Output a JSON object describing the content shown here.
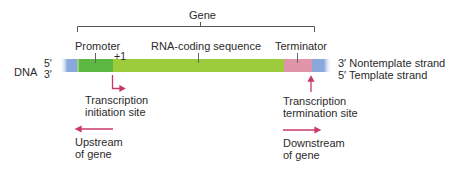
{
  "diagram": {
    "gene_label": "Gene",
    "dna_label": "DNA",
    "left_strand_ends": {
      "top": "5′",
      "bottom": "3′"
    },
    "right_strand_labels": {
      "top": "3′ Nontemplate strand",
      "bottom": "5′ Template strand"
    },
    "regions": [
      {
        "name": "promoter",
        "label": "Promoter",
        "color": "#5cb840"
      },
      {
        "name": "rna-coding-sequence",
        "label": "RNA-coding sequence",
        "color": "#9ccc3c"
      },
      {
        "name": "terminator",
        "label": "Terminator",
        "color": "#e096a8"
      }
    ],
    "flank_color": "#8aa8dc",
    "plus_one_label": "+1",
    "initiation_site": {
      "line1": "Transcription",
      "line2": "initiation site"
    },
    "termination_site": {
      "line1": "Transcription",
      "line2": "termination site"
    },
    "upstream": {
      "line1": "Upstream",
      "line2": "of gene"
    },
    "downstream": {
      "line1": "Downstream",
      "line2": "of gene"
    },
    "arrow_color": "#c8396a"
  }
}
